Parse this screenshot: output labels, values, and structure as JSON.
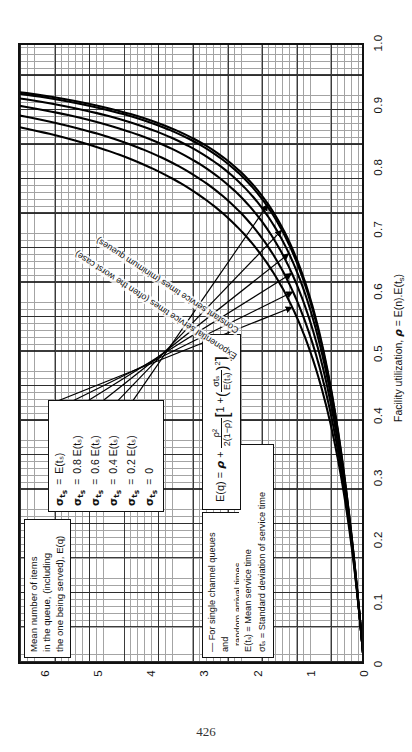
{
  "page": {
    "number": "426"
  },
  "chart_data": {
    "type": "line",
    "title": "",
    "xlabel": "Facility utilization, ρ = E(n).E(tₛ)",
    "ylabel": "Mean number of items in the queue, (including the one being served), E(q)",
    "xlim": [
      0,
      1.0
    ],
    "ylim": [
      0,
      6.5
    ],
    "grid": true,
    "legend_position": "inside-left",
    "xticks": [
      "0",
      "0.1",
      "0.2",
      "0.3",
      "0.4",
      "0.5",
      "0.6",
      "0.7",
      "0.8",
      "0.9",
      "1.0"
    ],
    "xtick_values": [
      0,
      0.1,
      0.2,
      0.3,
      0.4,
      0.5,
      0.6,
      0.7,
      0.8,
      0.9,
      1.0
    ],
    "yticks": [
      "0",
      "1",
      "2",
      "3",
      "4",
      "5",
      "6"
    ],
    "ytick_values": [
      0,
      1,
      2,
      3,
      4,
      5,
      6
    ],
    "x": [
      0,
      0.05,
      0.1,
      0.15,
      0.2,
      0.25,
      0.3,
      0.35,
      0.4,
      0.45,
      0.5,
      0.55,
      0.6,
      0.65,
      0.7,
      0.75,
      0.8,
      0.85,
      0.9,
      0.92,
      0.94,
      0.95
    ],
    "series": [
      {
        "name": "σtₛ = E(tₛ)",
        "k": 1.0,
        "label": "σtₛ = E(tₛ)",
        "values": [
          0,
          0.053,
          0.111,
          0.176,
          0.25,
          0.333,
          0.429,
          0.538,
          0.667,
          0.818,
          1.0,
          1.222,
          1.5,
          1.857,
          2.333,
          3.0,
          4.0,
          5.667,
          9.0,
          11.5,
          15.67,
          19.0
        ]
      },
      {
        "name": "σtₛ = 0.8 E(tₛ)",
        "k": 0.64,
        "label": "σtₛ = 0.8 E(tₛ)",
        "values": [
          0,
          0.052,
          0.109,
          0.172,
          0.241,
          0.318,
          0.406,
          0.506,
          0.623,
          0.76,
          0.922,
          1.118,
          1.36,
          1.667,
          2.07,
          2.625,
          3.46,
          4.807,
          7.44,
          9.414,
          12.7,
          15.3
        ]
      },
      {
        "name": "σtₛ = 0.6 E(tₛ)",
        "k": 0.36,
        "label": "σtₛ = 0.6 E(tₛ)",
        "values": [
          0,
          0.051,
          0.107,
          0.168,
          0.234,
          0.306,
          0.387,
          0.478,
          0.582,
          0.704,
          0.85,
          1.021,
          1.231,
          1.495,
          1.838,
          2.306,
          3.0,
          4.11,
          6.26,
          7.863,
          10.52,
          12.64
        ]
      },
      {
        "name": "σtₛ = 0.4 E(tₛ)",
        "k": 0.16,
        "label": "σtₛ = 0.4 E(tₛ)",
        "values": [
          0,
          0.051,
          0.105,
          0.165,
          0.229,
          0.299,
          0.375,
          0.459,
          0.554,
          0.663,
          0.792,
          0.941,
          1.124,
          1.351,
          1.646,
          2.044,
          2.632,
          3.568,
          5.372,
          6.712,
          8.934,
          10.71
        ]
      },
      {
        "name": "σtₛ = 0.2 E(tₛ)",
        "k": 0.04,
        "label": "σtₛ = 0.2 E(tₛ)",
        "values": [
          0,
          0.051,
          0.104,
          0.162,
          0.225,
          0.293,
          0.366,
          0.446,
          0.536,
          0.637,
          0.758,
          0.896,
          1.064,
          1.272,
          1.541,
          1.903,
          2.438,
          3.287,
          4.92,
          6.133,
          8.145,
          9.752
        ]
      },
      {
        "name": "σtₛ = 0",
        "k": 0.0,
        "label": "σtₛ = 0",
        "values": [
          0,
          0.051,
          0.103,
          0.161,
          0.225,
          0.292,
          0.364,
          0.444,
          0.533,
          0.634,
          0.75,
          0.886,
          1.05,
          1.254,
          1.517,
          1.875,
          2.4,
          3.242,
          4.95,
          6.04,
          8.0,
          9.525
        ]
      }
    ],
    "annotations": [
      {
        "text": "Exponential service times (often the worst case)"
      },
      {
        "text": "Constant service times (minimum queues)"
      }
    ]
  },
  "y_axis": {
    "caption_lines": [
      "Mean number of items",
      "in the queue, (including",
      "the one being served), E(q)"
    ]
  },
  "x_axis": {
    "title_prefix": "Facility utilization, ",
    "title_rho": "ρ",
    "title_rest": " = E(n).E(t",
    "title_sub": "s",
    "title_close": ")"
  },
  "legend": {
    "items": [
      {
        "symbol": "σ",
        "sub": "t",
        "sub2": "s",
        "eq": "=",
        "value": "E(tₛ)"
      },
      {
        "symbol": "σ",
        "sub": "t",
        "sub2": "s",
        "eq": "=",
        "value": "0.8 E(tₛ)"
      },
      {
        "symbol": "σ",
        "sub": "t",
        "sub2": "s",
        "eq": "=",
        "value": "0.6 E(tₛ)"
      },
      {
        "symbol": "σ",
        "sub": "t",
        "sub2": "s",
        "eq": "=",
        "value": "0.4 E(tₛ)"
      },
      {
        "symbol": "σ",
        "sub": "t",
        "sub2": "s",
        "eq": "=",
        "value": "0.2 E(tₛ)"
      },
      {
        "symbol": "σ",
        "sub": "t",
        "sub2": "s",
        "eq": "=",
        "value": "0"
      }
    ]
  },
  "formula": {
    "lhs": "E(q) = ",
    "rho1": "ρ",
    "plus": " + ",
    "frac_num": "ρ²",
    "frac_den": "2(1−ρ)",
    "bracket_open": "[",
    "one": "1",
    "plus2": "+",
    "inner_num": "σtₛ",
    "inner_den": "E(tₛ)",
    "power": "2",
    "bracket_close": "]"
  },
  "notes": {
    "line1": "— For single channel queues and",
    "line2": "random arrival times",
    "def1": "E(tₛ) = Mean service time",
    "def2": "σtₛ  = Standard deviation of service time"
  },
  "curve_labels": {
    "exponential": "Exponential service times (often the worst case)",
    "constant": "Constant service times (minimum queues)"
  }
}
